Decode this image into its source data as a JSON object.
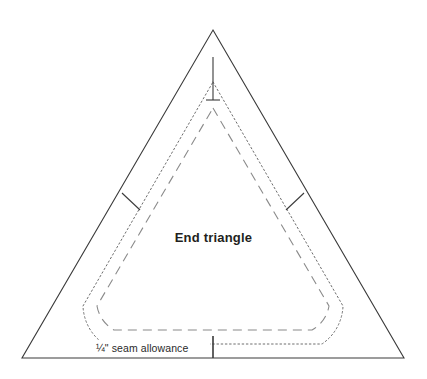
{
  "figure": {
    "kind": "sewing-pattern-template",
    "background_color": "#ffffff"
  },
  "labels": {
    "piece_name": "End triangle",
    "seam_allowance": "¼\" seam allowance"
  },
  "colors": {
    "outline": "#3a3a3a",
    "cut_line_dotted": "#6e6e6e",
    "stitch_line_dashed": "#8a8a8a",
    "tick_mark": "#3a3a3a",
    "text": "#231f20"
  },
  "geometry": {
    "outer_triangle": {
      "apex": [
        213,
        30
      ],
      "bottom_left": [
        22,
        358
      ],
      "bottom_right": [
        404,
        358
      ],
      "stroke_width": 1
    },
    "cut_line": {
      "style": "dotted",
      "corner_radius": 46,
      "apex": [
        213,
        80
      ],
      "bottom_left": [
        62,
        342
      ],
      "bottom_right": [
        364,
        342
      ]
    },
    "stitch_line": {
      "style": "dashed",
      "corner_radius": 44,
      "apex": [
        213,
        106
      ],
      "bottom_left": [
        84,
        330
      ],
      "bottom_right": [
        342,
        330
      ]
    },
    "apex_tick": {
      "x": 213,
      "y_top": 57,
      "y_bottom": 100,
      "crossbar_half_width": 6
    },
    "bottom_tick": {
      "x": 213,
      "y_top": 336,
      "y_bottom": 358
    },
    "left_edge_tick": {
      "from": [
        125,
        197
      ],
      "to": [
        143,
        211
      ]
    },
    "right_edge_tick": {
      "from": [
        301,
        197
      ],
      "to": [
        283,
        211
      ]
    }
  }
}
